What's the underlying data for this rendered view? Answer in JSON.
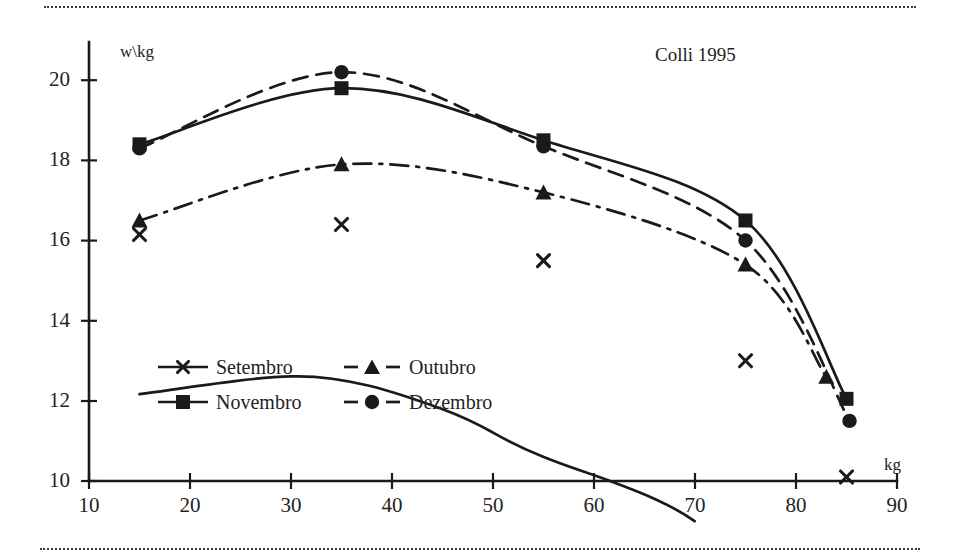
{
  "chart_data": {
    "type": "line",
    "title": "Colli 1995",
    "xlabel": "kg",
    "ylabel": "w\\kg",
    "xlim": [
      10,
      90
    ],
    "ylim": [
      10,
      20
    ],
    "xticks": [
      10,
      20,
      30,
      40,
      50,
      60,
      70,
      80,
      90
    ],
    "yticks": [
      10,
      12,
      14,
      16,
      18,
      20
    ],
    "grid": false,
    "legend_position": "inside-lower-left",
    "series": [
      {
        "name": "Setembro",
        "marker": "x",
        "linestyle": "solid",
        "x": [
          15,
          35,
          55,
          75,
          85
        ],
        "values": [
          16.15,
          16.4,
          15.5,
          13.0,
          10.1
        ]
      },
      {
        "name": "Novembro",
        "marker": "square",
        "linestyle": "solid",
        "x": [
          15,
          35,
          55,
          75,
          85
        ],
        "values": [
          18.4,
          19.8,
          18.5,
          16.5,
          12.05
        ]
      },
      {
        "name": "Outubro",
        "marker": "triangle",
        "linestyle": "dash-dot",
        "x": [
          15,
          35,
          55,
          75,
          83
        ],
        "values": [
          16.5,
          17.9,
          17.2,
          15.4,
          12.6
        ]
      },
      {
        "name": "Dezembro",
        "marker": "circle",
        "linestyle": "dashed",
        "x": [
          15,
          35,
          55,
          75,
          85.3
        ],
        "values": [
          18.3,
          20.2,
          18.35,
          16.0,
          11.5
        ]
      }
    ]
  },
  "axes": {
    "y_axis_label": "w\\kg",
    "x_axis_label": "kg",
    "y_tick_labels": [
      "20",
      "18",
      "16",
      "14",
      "12",
      "10"
    ],
    "x_tick_labels": [
      "10",
      "20",
      "30",
      "40",
      "50",
      "60",
      "70",
      "80",
      "90"
    ]
  },
  "title": "Colli 1995",
  "legend": {
    "entries": [
      {
        "label": "Setembro",
        "marker": "x-marker",
        "linestyle": "solid"
      },
      {
        "label": "Outubro",
        "marker": "triangle-marker",
        "linestyle": "dashed"
      },
      {
        "label": "Novembro",
        "marker": "square-marker",
        "linestyle": "solid"
      },
      {
        "label": "Dezembro",
        "marker": "circle-marker",
        "linestyle": "dashed"
      }
    ]
  },
  "colors": {
    "ink": "#1a1a1a",
    "rule": "#3c3c3c",
    "background": "#ffffff"
  }
}
